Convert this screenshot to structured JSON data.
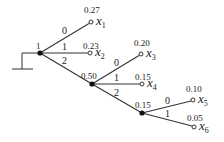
{
  "diagram": {
    "type": "huffman-code-tree",
    "root": {
      "label": "1",
      "x": 40,
      "y": 53
    },
    "ground": {
      "stem_x": 22,
      "top_y": 53,
      "bottom_y": 69,
      "bar_x1": 12,
      "bar_x2": 33
    },
    "internal_nodes": [
      {
        "id": "n1",
        "label": "1",
        "x": 40,
        "y": 53
      },
      {
        "id": "n2",
        "label": "0.50",
        "x": 92,
        "y": 84
      },
      {
        "id": "n3",
        "label": "0.15",
        "x": 142,
        "y": 113
      }
    ],
    "leaves": [
      {
        "id": "x1",
        "symbol": "x",
        "sub": "1",
        "prob": "0.27",
        "x": 91,
        "y": 22
      },
      {
        "id": "x2",
        "symbol": "x",
        "sub": "2",
        "prob": "0.23",
        "x": 90,
        "y": 53
      },
      {
        "id": "x3",
        "symbol": "x",
        "sub": "3",
        "prob": "0.20",
        "x": 141,
        "y": 54
      },
      {
        "id": "x4",
        "symbol": "x",
        "sub": "4",
        "prob": "0.15",
        "x": 142,
        "y": 84
      },
      {
        "id": "x5",
        "symbol": "x",
        "sub": "5",
        "prob": "0.10",
        "x": 193,
        "y": 100
      },
      {
        "id": "x6",
        "symbol": "x",
        "sub": "6",
        "prob": "0.05",
        "x": 194,
        "y": 127
      }
    ],
    "edges": [
      {
        "from": "n1",
        "to": "x1",
        "label": "0"
      },
      {
        "from": "n1",
        "to": "x2",
        "label": "1"
      },
      {
        "from": "n1",
        "to": "n2",
        "label": "2"
      },
      {
        "from": "n2",
        "to": "x3",
        "label": "0"
      },
      {
        "from": "n2",
        "to": "x4",
        "label": "1"
      },
      {
        "from": "n2",
        "to": "n3",
        "label": "2"
      },
      {
        "from": "n3",
        "to": "x5",
        "label": "0"
      },
      {
        "from": "n3",
        "to": "x6",
        "label": "1"
      }
    ]
  },
  "labels": {
    "root": "1",
    "n2": "0.50",
    "n3": "0.15",
    "e_n1_x1": "0",
    "e_n1_x2": "1",
    "e_n1_n2": "2",
    "e_n2_x3": "0",
    "e_n2_x4": "1",
    "e_n2_n3": "2",
    "e_n3_x5": "0",
    "e_n3_x6": "1",
    "p_x1": "0.27",
    "p_x2": "0.23",
    "p_x3": "0.20",
    "p_x4": "0.15",
    "p_x5": "0.10",
    "p_x6": "0.05",
    "sym": "x",
    "s1": "1",
    "s2": "2",
    "s3": "3",
    "s4": "4",
    "s5": "5",
    "s6": "6"
  }
}
